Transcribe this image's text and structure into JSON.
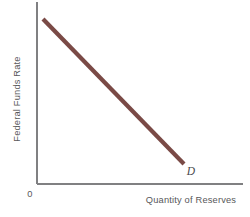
{
  "figure": {
    "background_color": "#ffffff",
    "width": 250,
    "height": 217
  },
  "axes": {
    "color": "#808082",
    "origin_label": "0",
    "x_label": "Quantity of Reserves",
    "y_label": "Federal Funds Rate",
    "x_axis": {
      "x1": 37,
      "y1": 184,
      "x2": 243,
      "y2": 184
    },
    "y_axis": {
      "x1": 37,
      "y1": 2,
      "x2": 37,
      "y2": 184
    }
  },
  "curve": {
    "label": "D",
    "color": "#7a4a46",
    "width": 4.2,
    "start": {
      "x": 43,
      "y": 19
    },
    "end": {
      "x": 184,
      "y": 164
    }
  },
  "chart_data": {
    "type": "line",
    "title": "",
    "subtitle": "",
    "xlabel": "Quantity of Reserves",
    "ylabel": "Federal Funds Rate",
    "grid": false,
    "legend_position": "inline-end-of-curve",
    "xlim": [
      0,
      1
    ],
    "ylim": [
      0,
      1
    ],
    "axis_tick_labels": {
      "x": [],
      "y": []
    },
    "origin_annotation": "0",
    "series": [
      {
        "name": "D",
        "label": "D",
        "color": "#7a4a46",
        "annotation": "Demand for reserves (downward sloping)",
        "x": [
          0.029,
          1.0
        ],
        "y": [
          1.0,
          0.11
        ],
        "points": [
          {
            "x": 0.029,
            "y": 1.0
          },
          {
            "x": 0.197,
            "y": 0.845
          },
          {
            "x": 0.368,
            "y": 0.688
          },
          {
            "x": 0.539,
            "y": 0.532
          },
          {
            "x": 0.71,
            "y": 0.376
          },
          {
            "x": 0.881,
            "y": 0.22
          },
          {
            "x": 1.0,
            "y": 0.11
          }
        ]
      }
    ],
    "annotations": [
      {
        "text": "D",
        "x": 0.748,
        "y": 0.066,
        "style": "italic"
      }
    ]
  }
}
